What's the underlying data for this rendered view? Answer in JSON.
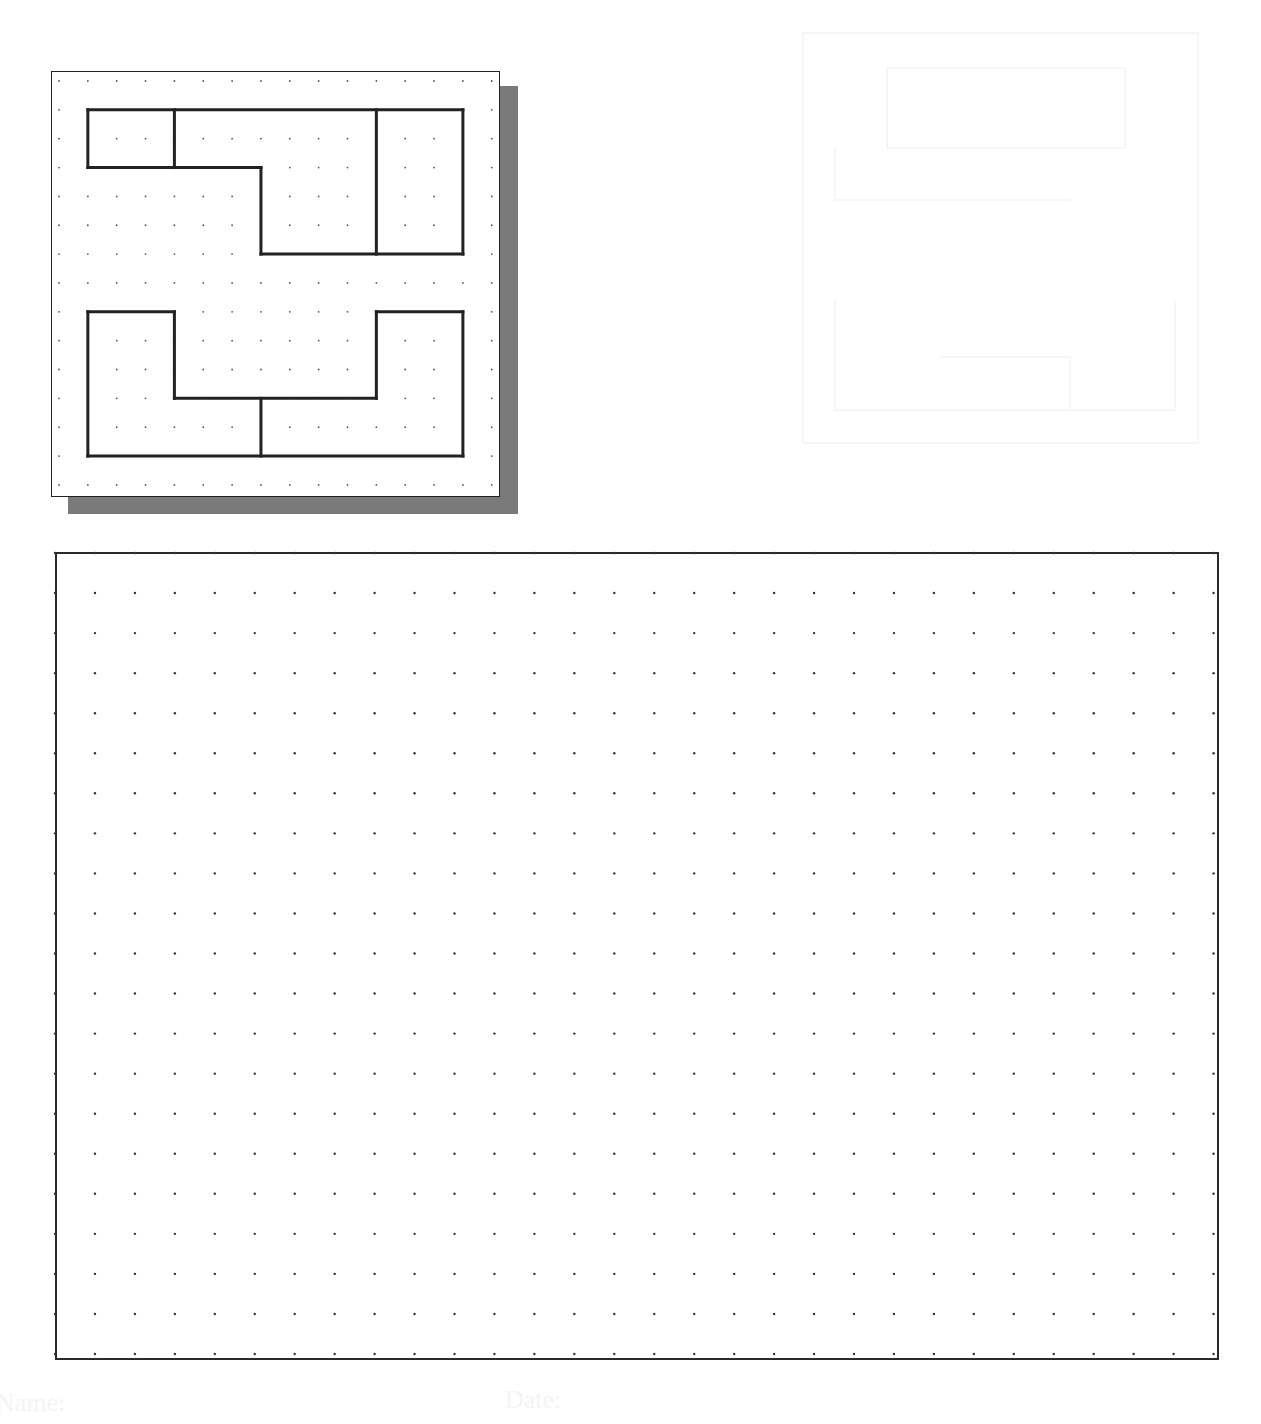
{
  "worksheet": {
    "reference_drawing": {
      "grid": {
        "origin": [
          59,
          81
        ],
        "spacing": 28.85,
        "cols": 16,
        "rows": 15,
        "dot_color": "#555555"
      },
      "line_color": "#222222",
      "shadow_color": "#7a7a7a",
      "shapes": [
        {
          "name": "top-shape",
          "segments": [
            [
              [
                1,
                1
              ],
              [
                14,
                1
              ]
            ],
            [
              [
                14,
                1
              ],
              [
                14,
                6
              ]
            ],
            [
              [
                14,
                6
              ],
              [
                7,
                6
              ]
            ],
            [
              [
                7,
                6
              ],
              [
                7,
                3
              ]
            ],
            [
              [
                7,
                3
              ],
              [
                1,
                3
              ]
            ],
            [
              [
                1,
                3
              ],
              [
                1,
                1
              ]
            ],
            [
              [
                4,
                1
              ],
              [
                4,
                3
              ]
            ],
            [
              [
                11,
                1
              ],
              [
                11,
                6
              ]
            ]
          ]
        },
        {
          "name": "bottom-shape",
          "segments": [
            [
              [
                1,
                8
              ],
              [
                4,
                8
              ]
            ],
            [
              [
                4,
                8
              ],
              [
                4,
                11
              ]
            ],
            [
              [
                4,
                11
              ],
              [
                11,
                11
              ]
            ],
            [
              [
                11,
                11
              ],
              [
                11,
                8
              ]
            ],
            [
              [
                11,
                8
              ],
              [
                14,
                8
              ]
            ],
            [
              [
                14,
                8
              ],
              [
                14,
                13
              ]
            ],
            [
              [
                14,
                13
              ],
              [
                1,
                13
              ]
            ],
            [
              [
                1,
                13
              ],
              [
                1,
                8
              ]
            ],
            [
              [
                7,
                11
              ],
              [
                7,
                13
              ]
            ]
          ]
        }
      ]
    },
    "sketch_area": {
      "grid": {
        "origin": [
          55,
          553
        ],
        "spacing_x": 39.95,
        "spacing_y": 40.05,
        "cols": 30,
        "rows": 21,
        "dot_color": "#333333"
      }
    },
    "footer": {
      "name_label": "Name:",
      "date_label": "Date:"
    }
  }
}
